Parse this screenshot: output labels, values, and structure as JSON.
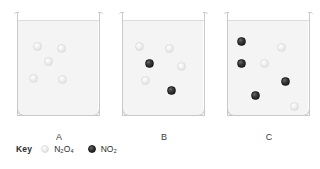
{
  "figure": {
    "background_color": "#ffffff",
    "beaker_fill_color": "#f4f4f4",
    "beaker_outline_color": "#c9c9c9"
  },
  "legend": {
    "title": "Key",
    "entries": [
      {
        "icon": "light-circle-icon",
        "species": "N₂O₄",
        "formula_base": "N",
        "color": "#e8e8e8"
      },
      {
        "icon": "dark-circle-icon",
        "species": "NO₂",
        "formula_base": "N",
        "color": "#242424"
      }
    ]
  },
  "containers": [
    {
      "id": "A",
      "label": "A",
      "left": 14,
      "counts": {
        "N2O4": 5,
        "NO2": 0
      },
      "molecules": [
        {
          "type": "N2O4",
          "x": 19,
          "y": 32
        },
        {
          "type": "N2O4",
          "x": 43,
          "y": 34
        },
        {
          "type": "N2O4",
          "x": 30,
          "y": 47
        },
        {
          "type": "N2O4",
          "x": 15,
          "y": 64
        },
        {
          "type": "N2O4",
          "x": 44,
          "y": 65
        }
      ]
    },
    {
      "id": "B",
      "label": "B",
      "left": 119,
      "counts": {
        "N2O4": 4,
        "NO2": 2
      },
      "molecules": [
        {
          "type": "N2O4",
          "x": 16,
          "y": 32
        },
        {
          "type": "N2O4",
          "x": 46,
          "y": 34
        },
        {
          "type": "NO2",
          "x": 26,
          "y": 49
        },
        {
          "type": "N2O4",
          "x": 58,
          "y": 52
        },
        {
          "type": "N2O4",
          "x": 22,
          "y": 66
        },
        {
          "type": "NO2",
          "x": 48,
          "y": 76
        }
      ]
    },
    {
      "id": "C",
      "label": "C",
      "left": 224,
      "counts": {
        "N2O4": 3,
        "NO2": 4
      },
      "molecules": [
        {
          "type": "NO2",
          "x": 13,
          "y": 27
        },
        {
          "type": "N2O4",
          "x": 53,
          "y": 33
        },
        {
          "type": "NO2",
          "x": 13,
          "y": 49
        },
        {
          "type": "N2O4",
          "x": 36,
          "y": 49
        },
        {
          "type": "NO2",
          "x": 57,
          "y": 67
        },
        {
          "type": "NO2",
          "x": 27,
          "y": 81
        },
        {
          "type": "N2O4",
          "x": 66,
          "y": 92
        }
      ]
    }
  ]
}
